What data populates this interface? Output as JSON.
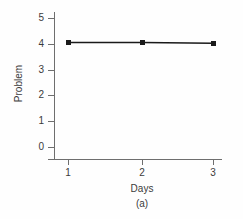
{
  "chart_data": {
    "type": "line",
    "title": "",
    "subtitle": "",
    "caption": "(a)",
    "xlabel": "Days",
    "ylabel": "Problem",
    "x": [
      1,
      2,
      3
    ],
    "categories": [
      "1",
      "2",
      "3"
    ],
    "series": [
      {
        "name": "Problem",
        "values": [
          4.05,
          4.05,
          4.02
        ],
        "color": "#1a1a1a",
        "marker": "square",
        "line_style": "solid"
      }
    ],
    "xlim": [
      0.7,
      3.3
    ],
    "ylim": [
      0,
      5
    ],
    "xticks": [
      1,
      2,
      3
    ],
    "yticks": [
      0,
      1,
      2,
      3,
      4,
      5
    ],
    "xticklabels": [
      "1",
      "2",
      "3"
    ],
    "yticklabels": [
      "0",
      "1",
      "2",
      "3",
      "4",
      "5"
    ],
    "grid": false,
    "legend": false,
    "legend_position": "none",
    "axis_color": "#6e6e6e",
    "text_color": "#3b3b3b",
    "background": "#fefefe"
  },
  "axes": {
    "y_ticks": [
      {
        "label": "5",
        "value": 5
      },
      {
        "label": "4",
        "value": 4
      },
      {
        "label": "3",
        "value": 3
      },
      {
        "label": "2",
        "value": 2
      },
      {
        "label": "1",
        "value": 1
      },
      {
        "label": "0",
        "value": 0
      }
    ],
    "x_ticks": [
      {
        "label": "1",
        "value": 1
      },
      {
        "label": "2",
        "value": 2
      },
      {
        "label": "3",
        "value": 3
      }
    ]
  }
}
